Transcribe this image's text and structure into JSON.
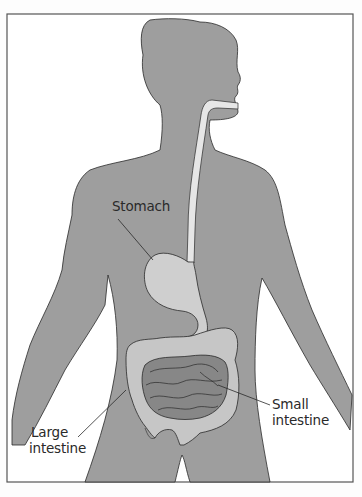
{
  "diagram": {
    "type": "anatomical-illustration",
    "colors": {
      "background": "#fdfdfd",
      "frame": "#555555",
      "body_silhouette": "#9e9e9e",
      "esophagus": "#e6e6e6",
      "stomach": "#cfcfcf",
      "large_intestine": "#c6c6c6",
      "small_intestine": "#878787",
      "outline": "#2a2a2a"
    },
    "labels": {
      "stomach": "Stomach",
      "large_intestine_line1": "Large",
      "large_intestine_line2": "intestine",
      "small_intestine_line1": "Small",
      "small_intestine_line2": "intestine"
    }
  }
}
